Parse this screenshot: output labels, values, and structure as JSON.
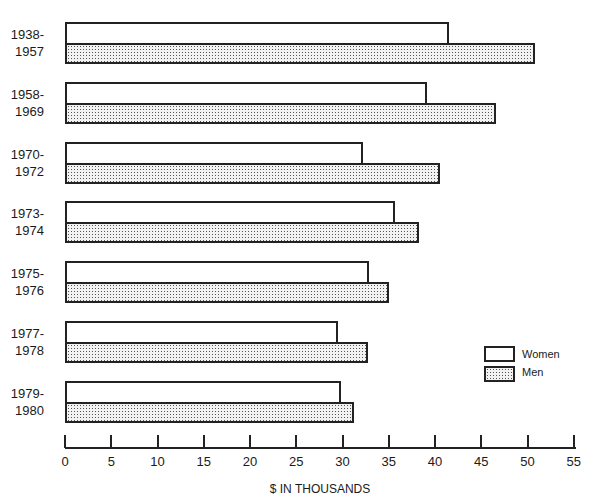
{
  "chart_data": {
    "type": "bar",
    "orientation": "horizontal",
    "title": "",
    "xlabel": "$ IN THOUSANDS",
    "ylabel": "",
    "xlim": [
      0,
      55
    ],
    "x_ticks": [
      0,
      5,
      10,
      15,
      20,
      25,
      30,
      35,
      40,
      45,
      50,
      55
    ],
    "grid": false,
    "legend_position": "right-lower",
    "categories": [
      "1938-\n1957",
      "1958-\n1969",
      "1970-\n1972",
      "1973-\n1974",
      "1975-\n1976",
      "1977-\n1978",
      "1979-\n1980"
    ],
    "category_lines": [
      [
        "1938-",
        "1957"
      ],
      [
        "1958-",
        "1969"
      ],
      [
        "1970-",
        "1972"
      ],
      [
        "1973-",
        "1974"
      ],
      [
        "1975-",
        "1976"
      ],
      [
        "1977-",
        "1978"
      ],
      [
        "1979-",
        "1980"
      ]
    ],
    "series": [
      {
        "name": "Women",
        "fill": "white",
        "values": [
          41.5,
          39.1,
          32.2,
          35.7,
          32.9,
          29.5,
          29.8
        ]
      },
      {
        "name": "Men",
        "fill": "stippled",
        "values": [
          50.8,
          46.6,
          40.5,
          38.3,
          35.0,
          32.8,
          31.2
        ]
      }
    ]
  },
  "legend": {
    "women": "Women",
    "men": "Men"
  },
  "colors": {
    "outline": "#222222",
    "stipple": "#555555",
    "background": "#ffffff"
  }
}
